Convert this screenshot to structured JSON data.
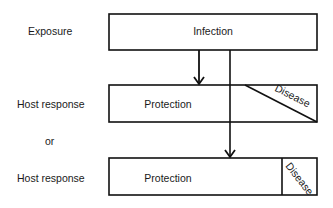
{
  "rows": {
    "exposure_label": "Exposure",
    "host_response_1_label": "Host response",
    "or_label": "or",
    "host_response_2_label": "Host response"
  },
  "boxes": {
    "infection": "Infection",
    "protection_1": "Protection",
    "disease_1": "Disease",
    "protection_2": "Protection",
    "disease_2": "Disease"
  },
  "colors": {
    "stroke": "#111111",
    "background": "#ffffff",
    "text": "#1a1a1a"
  }
}
